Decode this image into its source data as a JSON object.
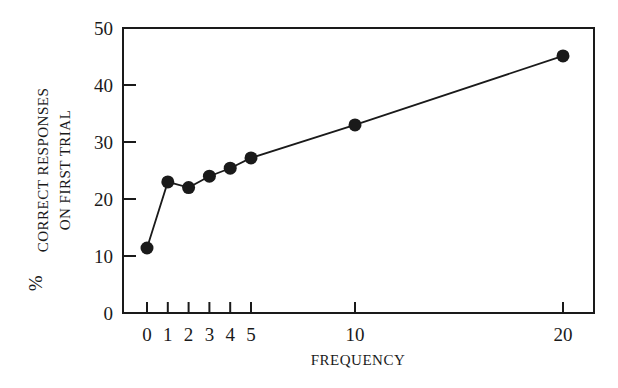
{
  "chart_data": {
    "type": "line",
    "title": "",
    "xlabel": "FREQUENCY",
    "ylabel": "% CORRECT RESPONSES ON FIRST TRIAL",
    "ylabel_lines": [
      "CORRECT RESPONSES",
      "ON FIRST TRIAL"
    ],
    "ylabel_prefix": "%",
    "x": [
      0,
      1,
      2,
      3,
      4,
      5,
      10,
      20
    ],
    "x_tick_labels": [
      "0",
      "1",
      "2",
      "3",
      "4",
      "5",
      "10",
      "20"
    ],
    "y_ticks": [
      0,
      10,
      20,
      30,
      40,
      50
    ],
    "y_tick_labels": [
      "0",
      "10",
      "20",
      "30",
      "40",
      "50"
    ],
    "ylim": [
      0,
      50
    ],
    "series": [
      {
        "name": "% correct",
        "values": [
          11.4,
          23.0,
          22.0,
          24.0,
          25.4,
          27.2,
          33.0,
          45.1
        ],
        "color": "#1a1a1a",
        "marker": "filled-circle"
      }
    ],
    "grid": false,
    "legend": null
  }
}
